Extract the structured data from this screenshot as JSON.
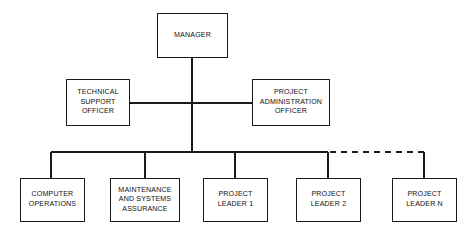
{
  "diagram": {
    "type": "organisational-chart",
    "background_color": "#ffffff",
    "line_color": "#1b1b1b",
    "text_color": "#111111",
    "nodes": [
      {
        "id": "manager",
        "name": "manager",
        "lines": [
          "MANAGER"
        ],
        "level": 0,
        "x": 157,
        "y": 13,
        "w": 71,
        "h": 45
      },
      {
        "id": "technical-support-officer",
        "name": "technical-support-officer",
        "lines": [
          "TECHNICAL",
          "SUPPORT",
          "OFFICER"
        ],
        "level": 1,
        "x": 66,
        "y": 79,
        "w": 64,
        "h": 47
      },
      {
        "id": "project-administration-officer",
        "name": "project-administration-officer",
        "lines": [
          "PROJECT",
          "ADMINISTRATION",
          "OFFICER"
        ],
        "level": 1,
        "x": 252,
        "y": 79,
        "w": 78,
        "h": 47
      },
      {
        "id": "computer-operations",
        "name": "computer-operations",
        "lines": [
          "COMPUTER",
          "OPERATIONS"
        ],
        "level": 2,
        "x": 20,
        "y": 178,
        "w": 65,
        "h": 44
      },
      {
        "id": "maintenance-and-systems-assurance",
        "name": "maintenance-and-systems-assurance",
        "lines": [
          "MAINTENANCE",
          "AND SYSTEMS",
          "ASSURANCE"
        ],
        "level": 2,
        "x": 110,
        "y": 178,
        "w": 70,
        "h": 44
      },
      {
        "id": "project-leader-1",
        "name": "project-leader-1",
        "lines": [
          "PROJECT",
          "LEADER 1"
        ],
        "level": 2,
        "x": 203,
        "y": 178,
        "w": 65,
        "h": 44
      },
      {
        "id": "project-leader-2",
        "name": "project-leader-2",
        "lines": [
          "PROJECT",
          "LEADER 2"
        ],
        "level": 2,
        "x": 296,
        "y": 178,
        "w": 65,
        "h": 44
      },
      {
        "id": "project-leader-n",
        "name": "project-leader-n",
        "lines": [
          "PROJECT",
          "LEADER N"
        ],
        "level": 2,
        "x": 392,
        "y": 178,
        "w": 65,
        "h": 44
      }
    ],
    "connectors": {
      "manager_trunk": {
        "x": 192,
        "y1": 58,
        "y2": 152,
        "style": "solid"
      },
      "officer_bar": {
        "y": 103,
        "x1": 130,
        "x2": 252,
        "style": "solid"
      },
      "distribution_bus": {
        "y": 152,
        "x1": 51,
        "x2": 328,
        "style": "solid"
      },
      "dashed_extension": {
        "y": 152,
        "x1": 330,
        "x2": 424,
        "style": "dashed",
        "dash": "6 5"
      },
      "drops": [
        {
          "to": "computer-operations",
          "x": 51,
          "y1": 152,
          "y2": 178,
          "style": "solid"
        },
        {
          "to": "maintenance-and-systems-assurance",
          "x": 145,
          "y1": 152,
          "y2": 178,
          "style": "solid"
        },
        {
          "to": "project-leader-1",
          "x": 235,
          "y1": 152,
          "y2": 178,
          "style": "solid"
        },
        {
          "to": "project-leader-2",
          "x": 328,
          "y1": 152,
          "y2": 178,
          "style": "solid"
        },
        {
          "to": "project-leader-n",
          "x": 424,
          "y1": 152,
          "y2": 178,
          "style": "solid"
        }
      ]
    }
  }
}
